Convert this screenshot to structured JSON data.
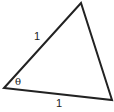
{
  "diagram": {
    "type": "triangle",
    "vertices": {
      "A": [
        4,
        88
      ],
      "B": [
        81,
        3
      ],
      "C": [
        112,
        100
      ]
    },
    "stroke_color": "#222222",
    "labels": {
      "side_ab": "1",
      "side_ac": "1",
      "angle_a": "θ"
    }
  }
}
